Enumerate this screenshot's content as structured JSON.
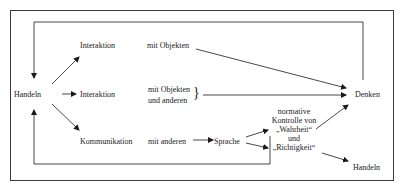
{
  "diagram": {
    "nodes": {
      "handeln_left": "Handeln",
      "interaktion_top": "Interaktion",
      "interaktion_mid": "Interaktion",
      "kommunikation": "Kommunikation",
      "mit_objekten_top": "mit Objekten",
      "mit_objekten_mid_1": "mit Objekten",
      "mit_objekten_mid_2": "und anderen",
      "mit_anderen": "mit anderen",
      "sprache": "Sprache",
      "normative_1": "normative",
      "normative_2": "Kontrolle von",
      "normative_3": "„Wahrheit“",
      "normative_4": "und",
      "normative_5": "„Richtigkeit“",
      "denken": "Denken",
      "handeln_right": "Handeln",
      "brace": "}"
    },
    "edges": [
      {
        "from": "Handeln",
        "to": "Interaktion (mit Objekten)"
      },
      {
        "from": "Handeln",
        "to": "Interaktion (mit Objekten und anderen)"
      },
      {
        "from": "Handeln",
        "to": "Kommunikation"
      },
      {
        "from": "mit Objekten",
        "to": "Denken"
      },
      {
        "from": "mit Objekten und anderen",
        "to": "Denken"
      },
      {
        "from": "mit anderen",
        "to": "Sprache"
      },
      {
        "from": "Sprache",
        "to": "normative Kontrolle von „Wahrheit“"
      },
      {
        "from": "Sprache",
        "to": "„Richtigkeit“"
      },
      {
        "from": "„Wahrheit“",
        "to": "Denken"
      },
      {
        "from": "„Richtigkeit“",
        "to": "Handeln"
      },
      {
        "from": "Denken",
        "to": "Handeln",
        "via": "top feedback loop"
      },
      {
        "from": "Sprache",
        "to": "Handeln",
        "via": "bottom feedback loop"
      }
    ],
    "colors": {
      "line": "#1a1a1a",
      "frame": "#3a3a3a",
      "background": "#ffffff"
    }
  }
}
